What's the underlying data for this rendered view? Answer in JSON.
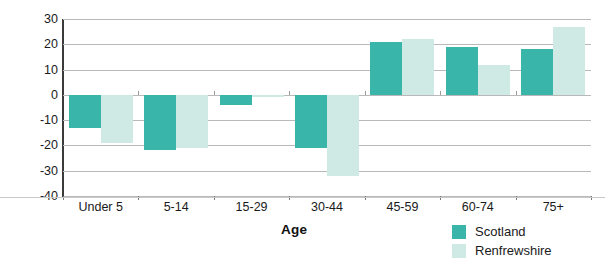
{
  "chart_data": {
    "type": "bar",
    "title": "",
    "xlabel": "Age",
    "ylabel": "Percent",
    "categories": [
      "Under 5",
      "5-14",
      "15-29",
      "30-44",
      "45-59",
      "60-74",
      "75+"
    ],
    "series": [
      {
        "name": "Scotland",
        "color": "#3ab5aa",
        "values": [
          -13,
          -22,
          -4,
          -21,
          21,
          19,
          18
        ]
      },
      {
        "name": "Renfrewshire",
        "color": "#cfeae5",
        "values": [
          -19,
          -21,
          -1,
          -32,
          22,
          12,
          27
        ]
      }
    ],
    "ylim": [
      -40,
      30
    ],
    "yticks": [
      30,
      20,
      10,
      0,
      -10,
      -20,
      -30,
      -40
    ],
    "ytick_labels": [
      "30",
      "20",
      "10",
      "0",
      "-10",
      "-20",
      "-30",
      "-40"
    ],
    "grid": true,
    "legend_position": "bottom-right"
  },
  "axes": {
    "y_title": "Percent",
    "x_title": "Age"
  },
  "legend": {
    "entries": [
      {
        "label": "Scotland",
        "color": "#3ab5aa"
      },
      {
        "label": "Renfrewshire",
        "color": "#cfeae5"
      }
    ]
  }
}
